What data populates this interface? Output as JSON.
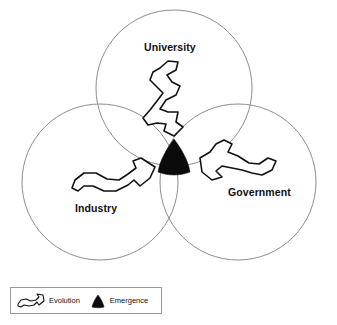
{
  "diagram": {
    "type": "venn-three-circle",
    "background_color": "#ffffff",
    "circle_stroke_color": "#8d8d8d",
    "arrow_stroke_color": "#111111",
    "emergence_fill_color": "#0b0b0b",
    "spheres": [
      {
        "id": "university",
        "label": "University",
        "position": "top",
        "arrow_direction": "down-toward-center",
        "icon": "evolution-arrow-icon"
      },
      {
        "id": "industry",
        "label": "Industry",
        "position": "bottom-left",
        "arrow_direction": "right-toward-center",
        "icon": "evolution-arrow-icon"
      },
      {
        "id": "government",
        "label": "Government",
        "position": "bottom-right",
        "arrow_direction": "left-toward-center",
        "icon": "evolution-arrow-icon"
      }
    ],
    "center": {
      "id": "emergence",
      "shape": "curved-triangle",
      "fill": "#0b0b0b"
    }
  },
  "legend": {
    "border_color": "#9a9a9a",
    "entries": [
      {
        "id": "evolution",
        "label": "Evolution",
        "icon": "evolution-arrow-icon",
        "swatch_style": "white-outlined-wavy-arrow"
      },
      {
        "id": "emergence",
        "label": "Emergence",
        "icon": "emergence-triangle-icon",
        "swatch_style": "solid-black-triangle"
      }
    ]
  }
}
